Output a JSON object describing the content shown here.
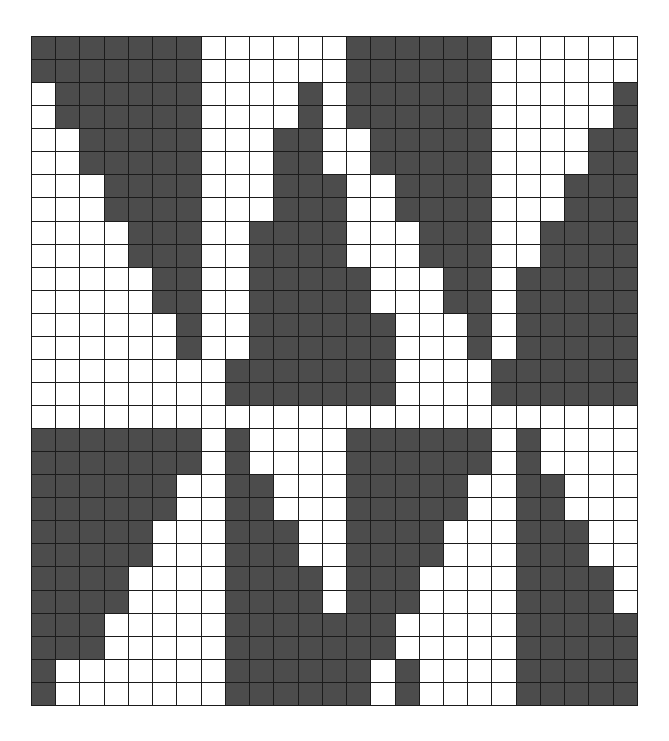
{
  "figure": {
    "title": "",
    "kind": "binary-cell-grid",
    "columns": 25,
    "rows": 29,
    "cell_on_label": "filled",
    "cell_off_label": "empty",
    "colors": {
      "background": "#ffffff",
      "cell_on": "#4c4c4c",
      "cell_off": "#ffffff",
      "gridline": "#1b1b1b"
    }
  },
  "chart_data": {
    "type": "heatmap",
    "title": "",
    "subtitle": "",
    "xlabel": "",
    "ylabel": "",
    "grid": true,
    "legend_position": "none",
    "xlim": [
      0,
      25
    ],
    "ylim": [
      0,
      29
    ],
    "categories_x": [
      "0",
      "1",
      "2",
      "3",
      "4",
      "5",
      "6",
      "7",
      "8",
      "9",
      "10",
      "11",
      "12",
      "13",
      "14",
      "15",
      "16",
      "17",
      "18",
      "19",
      "20",
      "21",
      "22",
      "23",
      "24"
    ],
    "categories_y": [
      "0",
      "1",
      "2",
      "3",
      "4",
      "5",
      "6",
      "7",
      "8",
      "9",
      "10",
      "11",
      "12",
      "13",
      "14",
      "15",
      "16",
      "17",
      "18",
      "19",
      "20",
      "21",
      "22",
      "23",
      "24",
      "25",
      "26",
      "27",
      "28"
    ],
    "value_labels": {
      "0": "empty",
      "1": "filled"
    },
    "colorscale": [
      "#ffffff",
      "#4c4c4c"
    ],
    "matrix": [
      [
        1,
        1,
        1,
        1,
        1,
        1,
        1,
        0,
        0,
        0,
        0,
        0,
        0,
        1,
        1,
        1,
        1,
        1,
        1,
        0,
        0,
        0,
        0,
        0,
        0
      ],
      [
        1,
        1,
        1,
        1,
        1,
        1,
        1,
        0,
        0,
        0,
        0,
        0,
        0,
        1,
        1,
        1,
        1,
        1,
        1,
        0,
        0,
        0,
        0,
        0,
        0
      ],
      [
        0,
        1,
        1,
        1,
        1,
        1,
        1,
        0,
        0,
        0,
        0,
        1,
        0,
        1,
        1,
        1,
        1,
        1,
        1,
        0,
        0,
        0,
        0,
        0,
        1
      ],
      [
        0,
        1,
        1,
        1,
        1,
        1,
        1,
        0,
        0,
        0,
        0,
        1,
        0,
        1,
        1,
        1,
        1,
        1,
        1,
        0,
        0,
        0,
        0,
        0,
        1
      ],
      [
        0,
        0,
        1,
        1,
        1,
        1,
        1,
        0,
        0,
        0,
        1,
        1,
        0,
        0,
        1,
        1,
        1,
        1,
        1,
        0,
        0,
        0,
        0,
        1,
        1
      ],
      [
        0,
        0,
        1,
        1,
        1,
        1,
        1,
        0,
        0,
        0,
        1,
        1,
        0,
        0,
        1,
        1,
        1,
        1,
        1,
        0,
        0,
        0,
        0,
        1,
        1
      ],
      [
        0,
        0,
        0,
        1,
        1,
        1,
        1,
        0,
        0,
        0,
        1,
        1,
        1,
        0,
        0,
        1,
        1,
        1,
        1,
        0,
        0,
        0,
        1,
        1,
        1
      ],
      [
        0,
        0,
        0,
        1,
        1,
        1,
        1,
        0,
        0,
        0,
        1,
        1,
        1,
        0,
        0,
        1,
        1,
        1,
        1,
        0,
        0,
        0,
        1,
        1,
        1
      ],
      [
        0,
        0,
        0,
        0,
        1,
        1,
        1,
        0,
        0,
        1,
        1,
        1,
        1,
        0,
        0,
        0,
        1,
        1,
        1,
        0,
        0,
        1,
        1,
        1,
        1
      ],
      [
        0,
        0,
        0,
        0,
        1,
        1,
        1,
        0,
        0,
        1,
        1,
        1,
        1,
        0,
        0,
        0,
        1,
        1,
        1,
        0,
        0,
        1,
        1,
        1,
        1
      ],
      [
        0,
        0,
        0,
        0,
        0,
        1,
        1,
        0,
        0,
        1,
        1,
        1,
        1,
        1,
        0,
        0,
        0,
        1,
        1,
        0,
        1,
        1,
        1,
        1,
        1
      ],
      [
        0,
        0,
        0,
        0,
        0,
        1,
        1,
        0,
        0,
        1,
        1,
        1,
        1,
        1,
        0,
        0,
        0,
        1,
        1,
        0,
        1,
        1,
        1,
        1,
        1
      ],
      [
        0,
        0,
        0,
        0,
        0,
        0,
        1,
        0,
        0,
        1,
        1,
        1,
        1,
        1,
        1,
        0,
        0,
        0,
        1,
        0,
        1,
        1,
        1,
        1,
        1
      ],
      [
        0,
        0,
        0,
        0,
        0,
        0,
        1,
        0,
        0,
        1,
        1,
        1,
        1,
        1,
        1,
        0,
        0,
        0,
        1,
        0,
        1,
        1,
        1,
        1,
        1
      ],
      [
        0,
        0,
        0,
        0,
        0,
        0,
        0,
        0,
        1,
        1,
        1,
        1,
        1,
        1,
        1,
        0,
        0,
        0,
        0,
        1,
        1,
        1,
        1,
        1,
        1
      ],
      [
        0,
        0,
        0,
        0,
        0,
        0,
        0,
        0,
        1,
        1,
        1,
        1,
        1,
        1,
        1,
        0,
        0,
        0,
        0,
        1,
        1,
        1,
        1,
        1,
        1
      ],
      [
        0,
        0,
        0,
        0,
        0,
        0,
        0,
        0,
        0,
        0,
        0,
        0,
        0,
        0,
        0,
        0,
        0,
        0,
        0,
        0,
        0,
        0,
        0,
        0,
        0
      ],
      [
        1,
        1,
        1,
        1,
        1,
        1,
        1,
        0,
        1,
        0,
        0,
        0,
        0,
        1,
        1,
        1,
        1,
        1,
        1,
        0,
        1,
        0,
        0,
        0,
        0
      ],
      [
        1,
        1,
        1,
        1,
        1,
        1,
        1,
        0,
        1,
        0,
        0,
        0,
        0,
        1,
        1,
        1,
        1,
        1,
        1,
        0,
        1,
        0,
        0,
        0,
        0
      ],
      [
        1,
        1,
        1,
        1,
        1,
        1,
        0,
        0,
        1,
        1,
        0,
        0,
        0,
        1,
        1,
        1,
        1,
        1,
        0,
        0,
        1,
        1,
        0,
        0,
        0
      ],
      [
        1,
        1,
        1,
        1,
        1,
        1,
        0,
        0,
        1,
        1,
        0,
        0,
        0,
        1,
        1,
        1,
        1,
        1,
        0,
        0,
        1,
        1,
        0,
        0,
        0
      ],
      [
        1,
        1,
        1,
        1,
        1,
        0,
        0,
        0,
        1,
        1,
        1,
        0,
        0,
        1,
        1,
        1,
        1,
        0,
        0,
        0,
        1,
        1,
        1,
        0,
        0
      ],
      [
        1,
        1,
        1,
        1,
        1,
        0,
        0,
        0,
        1,
        1,
        1,
        0,
        0,
        1,
        1,
        1,
        1,
        0,
        0,
        0,
        1,
        1,
        1,
        0,
        0
      ],
      [
        1,
        1,
        1,
        1,
        0,
        0,
        0,
        0,
        1,
        1,
        1,
        1,
        0,
        1,
        1,
        1,
        0,
        0,
        0,
        0,
        1,
        1,
        1,
        1,
        0
      ],
      [
        1,
        1,
        1,
        1,
        0,
        0,
        0,
        0,
        1,
        1,
        1,
        1,
        0,
        1,
        1,
        1,
        0,
        0,
        0,
        0,
        1,
        1,
        1,
        1,
        0
      ],
      [
        1,
        1,
        1,
        0,
        0,
        0,
        0,
        0,
        1,
        1,
        1,
        1,
        1,
        1,
        1,
        0,
        0,
        0,
        0,
        0,
        1,
        1,
        1,
        1,
        1
      ],
      [
        1,
        1,
        1,
        0,
        0,
        0,
        0,
        0,
        1,
        1,
        1,
        1,
        1,
        1,
        1,
        0,
        0,
        0,
        0,
        0,
        1,
        1,
        1,
        1,
        1
      ],
      [
        1,
        0,
        0,
        0,
        0,
        0,
        0,
        0,
        1,
        1,
        1,
        1,
        1,
        1,
        0,
        1,
        0,
        0,
        0,
        0,
        1,
        1,
        1,
        1,
        1
      ],
      [
        1,
        0,
        0,
        0,
        0,
        0,
        0,
        0,
        1,
        1,
        1,
        1,
        1,
        1,
        0,
        1,
        0,
        0,
        0,
        0,
        1,
        1,
        1,
        1,
        1
      ]
    ]
  }
}
